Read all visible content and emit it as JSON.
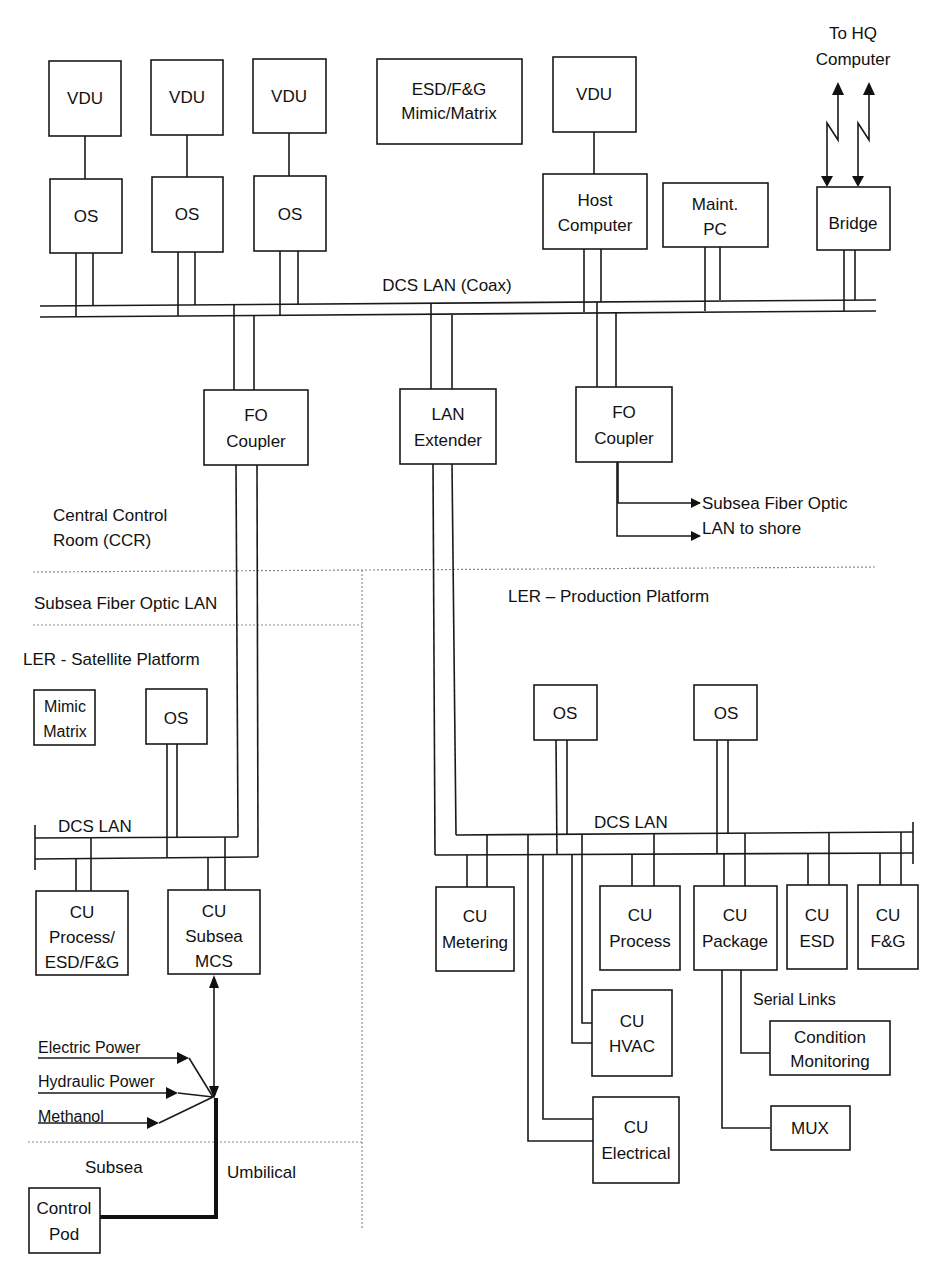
{
  "diagram": {
    "ccr": {
      "vdu_label": "VDU",
      "os_label": "OS",
      "esd_mimic": [
        "ESD/F&G",
        "Mimic/Matrix"
      ],
      "host_computer": [
        "Host",
        "Computer"
      ],
      "maint_pc": [
        "Maint.",
        "PC"
      ],
      "bridge": "Bridge",
      "to_hq": [
        "To HQ",
        "Computer"
      ],
      "bus_label": "DCS LAN (Coax)",
      "fo_coupler": [
        "FO",
        "Coupler"
      ],
      "lan_extender": [
        "LAN",
        "Extender"
      ],
      "shore_link": [
        "Subsea Fiber Optic",
        "LAN to shore"
      ],
      "zone_label": [
        "Central Control",
        "Room (CCR)"
      ]
    },
    "subsea_fo_lan": "Subsea Fiber Optic LAN",
    "satellite": {
      "zone_label": "LER - Satellite Platform",
      "mimic_matrix": [
        "Mimic",
        "Matrix"
      ],
      "os_label": "OS",
      "bus_label": "DCS LAN",
      "cu_process": [
        "CU",
        "Process/",
        "ESD/F&G"
      ],
      "cu_subsea": [
        "CU",
        "Subsea",
        "MCS"
      ],
      "inputs": [
        "Electric Power",
        "Hydraulic Power",
        "Methanol"
      ],
      "subsea_label": "Subsea",
      "umbilical_label": "Umbilical",
      "control_pod": [
        "Control",
        "Pod"
      ]
    },
    "production": {
      "zone_label": "LER – Production Platform",
      "os_label": "OS",
      "bus_label": "DCS LAN",
      "cu_metering": [
        "CU",
        "Metering"
      ],
      "cu_process": [
        "CU",
        "Process"
      ],
      "cu_package": [
        "CU",
        "Package"
      ],
      "cu_esd": [
        "CU",
        "ESD"
      ],
      "cu_fg": [
        "CU",
        "F&G"
      ],
      "cu_hvac": [
        "CU",
        "HVAC"
      ],
      "cu_electrical": [
        "CU",
        "Electrical"
      ],
      "serial_links": "Serial Links",
      "condition_monitoring": [
        "Condition",
        "Monitoring"
      ],
      "mux": "MUX"
    }
  }
}
